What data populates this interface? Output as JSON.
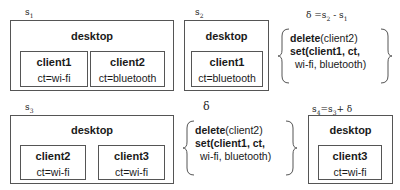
{
  "states": [
    {
      "label": "s1",
      "label_base": "s",
      "label_sub": "1",
      "root": "desktop",
      "clients": [
        {
          "name": "client1",
          "ct": "ct=wi-fi"
        },
        {
          "name": "client2",
          "ct": "ct=bluetooth"
        }
      ]
    },
    {
      "label": "s2",
      "label_base": "s",
      "label_sub": "2",
      "root": "desktop",
      "clients": [
        {
          "name": "client1",
          "ct": "ct=bluetooth"
        }
      ]
    },
    {
      "label": "s3",
      "label_base": "s",
      "label_sub": "3",
      "root": "desktop",
      "clients": [
        {
          "name": "client2",
          "ct": "ct=wi-fi"
        },
        {
          "name": "client3",
          "ct": "ct=wi-fi"
        }
      ]
    },
    {
      "label": "s4=s3+δ",
      "label_base": "s",
      "label_sub": "4",
      "label_rest": "=s",
      "label_sub2": "3",
      "label_tail": "+ δ",
      "root": "desktop",
      "clients": [
        {
          "name": "client3",
          "ct": "ct=wi-fi"
        }
      ]
    }
  ],
  "deltas": [
    {
      "caption": "δ =s2 - s1",
      "caption_parts": {
        "a": "δ =s",
        "b": "2",
        "c": " - s",
        "d": "1"
      },
      "op1_keyword": "delete",
      "op1_arg": "(client2)",
      "op2_line1": "set(client1, ct,",
      "op2_line2": "wi-fi, bluetooth)"
    },
    {
      "caption": "δ",
      "op1_keyword": "delete",
      "op1_arg": "(client2)",
      "op2_line1": "set(client1, ct,",
      "op2_line2": "wi-fi, bluetooth)"
    }
  ]
}
